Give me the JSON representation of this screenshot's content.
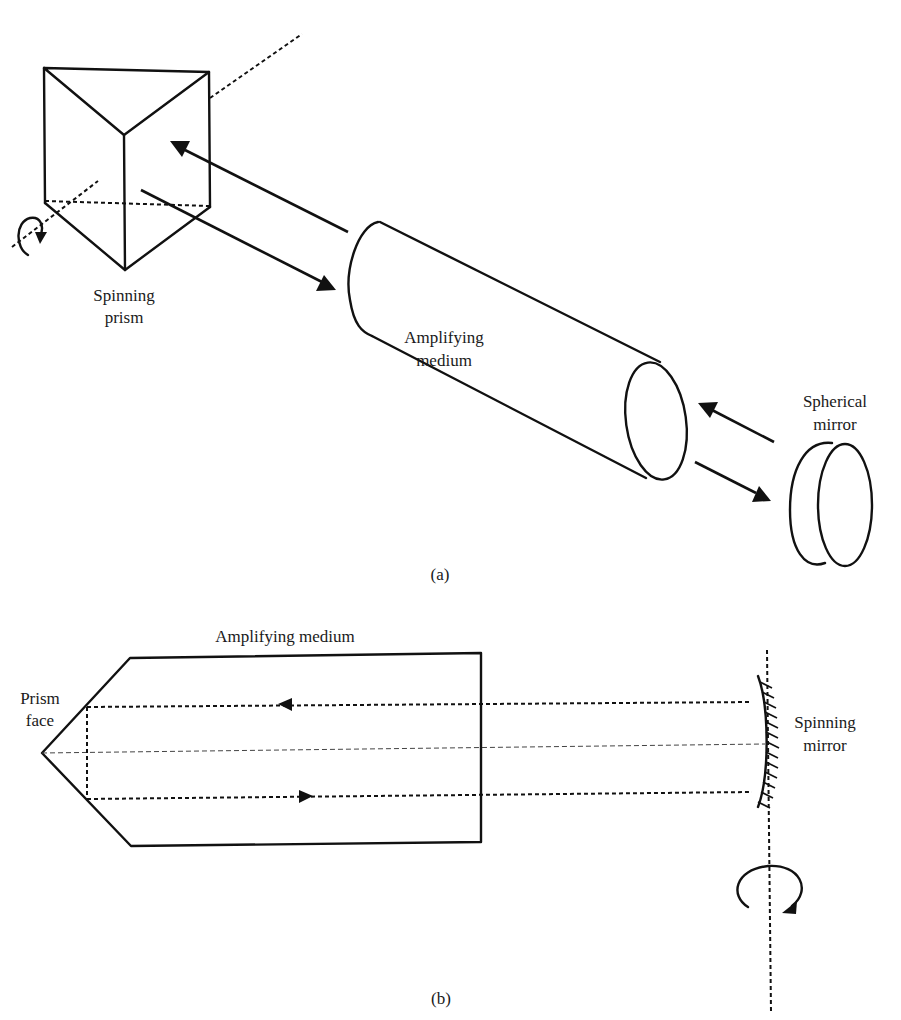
{
  "figure": {
    "panel_a": {
      "caption": "(a)",
      "labels": {
        "prism": [
          "Spinning",
          "prism"
        ],
        "medium": [
          "Amplifying",
          "medium"
        ],
        "mirror": [
          "Spherical",
          "mirror"
        ]
      },
      "components": [
        "spinning-prism",
        "amplifying-medium-cylinder",
        "spherical-mirror",
        "rotation-axis",
        "beam-arrows"
      ]
    },
    "panel_b": {
      "caption": "(b)",
      "labels": {
        "medium": "Amplifying medium",
        "prism_face": [
          "Prism",
          "face"
        ],
        "mirror": [
          "Spinning",
          "mirror"
        ]
      },
      "components": [
        "amplifying-medium-outline",
        "prism-face",
        "beam-paths",
        "optical-axis",
        "spinning-mirror",
        "rotation-axis",
        "rotation-arrow"
      ]
    },
    "colors": {
      "line": "#111111",
      "background": "#ffffff"
    }
  }
}
